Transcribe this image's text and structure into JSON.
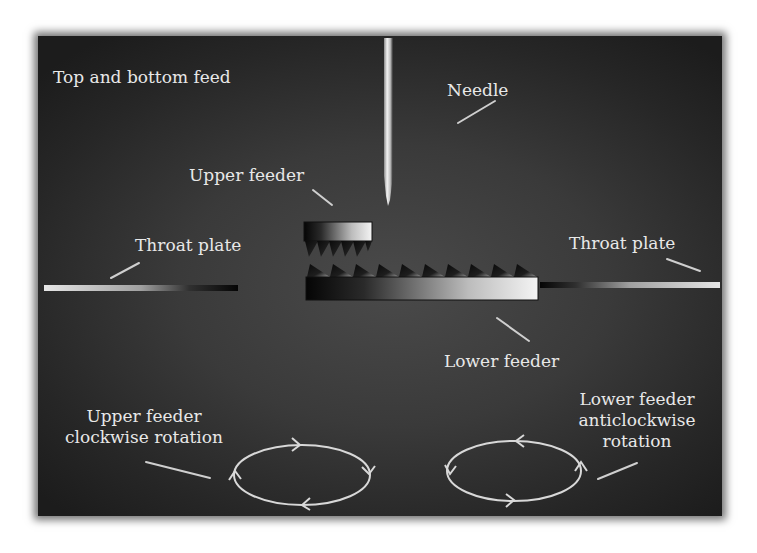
{
  "diagram": {
    "title": "Top and bottom feed",
    "labels": {
      "needle": "Needle",
      "upper_feeder": "Upper feeder",
      "throat_plate_left": "Throat plate",
      "throat_plate_right": "Throat plate",
      "lower_feeder": "Lower feeder",
      "upper_rotation_line1": "Upper feeder",
      "upper_rotation_line2": "clockwise rotation",
      "lower_rotation_line1": "Lower feeder",
      "lower_rotation_line2": "anticlockwise",
      "lower_rotation_line3": "rotation"
    },
    "components": [
      "needle",
      "upper feeder",
      "lower feeder",
      "throat plate (left)",
      "throat plate (right)",
      "upper feeder rotation path (clockwise)",
      "lower feeder rotation path (anticlockwise)"
    ],
    "colors": {
      "background": "#333333",
      "text": "#e8e8e8",
      "metal_light": "#f0f0f0",
      "metal_dark": "#0a0a0a"
    }
  }
}
